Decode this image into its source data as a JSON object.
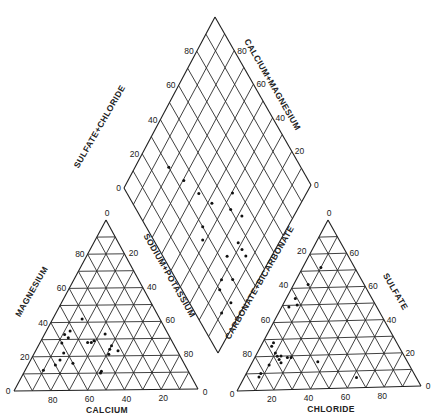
{
  "chart_data": {
    "type": "scatter",
    "components": {
      "cation_triangle": {
        "axes": {
          "magnesium": {
            "label": "MAGNESIUM",
            "ticks": [
              "20",
              "40",
              "60",
              "80"
            ]
          },
          "calcium": {
            "label": "CALCIUM",
            "ticks": [
              "80",
              "60",
              "40",
              "20"
            ]
          },
          "sodium_potassium": {
            "label": "SODIUM+POTASSIUM",
            "ticks": [
              "20",
              "40",
              "60",
              "80"
            ]
          }
        },
        "corner_labels": [
          "0",
          "0",
          "0"
        ],
        "points_pct": [
          {
            "ca": 42,
            "mg": 42,
            "na": 16
          },
          {
            "ca": 52,
            "mg": 35,
            "na": 13
          },
          {
            "ca": 56,
            "mg": 33,
            "na": 11
          },
          {
            "ca": 55,
            "mg": 31,
            "na": 14
          },
          {
            "ca": 60,
            "mg": 28,
            "na": 12
          },
          {
            "ca": 44,
            "mg": 28,
            "na": 28
          },
          {
            "ca": 42,
            "mg": 29,
            "na": 29
          },
          {
            "ca": 46,
            "mg": 28,
            "na": 26
          },
          {
            "ca": 36,
            "mg": 24,
            "na": 40
          },
          {
            "ca": 34,
            "mg": 26,
            "na": 40
          },
          {
            "ca": 32,
            "mg": 23,
            "na": 45
          },
          {
            "ca": 38,
            "mg": 21,
            "na": 41
          },
          {
            "ca": 62,
            "mg": 22,
            "na": 16
          },
          {
            "ca": 66,
            "mg": 18,
            "na": 16
          },
          {
            "ca": 60,
            "mg": 16,
            "na": 24
          },
          {
            "ca": 70,
            "mg": 15,
            "na": 15
          },
          {
            "ca": 78,
            "mg": 12,
            "na": 10
          },
          {
            "ca": 48,
            "mg": 10,
            "na": 42
          },
          {
            "ca": 47,
            "mg": 11,
            "na": 42
          },
          {
            "ca": 34,
            "mg": 33,
            "na": 33
          }
        ]
      },
      "anion_triangle": {
        "axes": {
          "sulfate": {
            "label": "SULFATE",
            "ticks": [
              "20",
              "40",
              "60",
              "60"
            ]
          },
          "chloride": {
            "label": "CHLORIDE",
            "ticks": [
              "20",
              "40",
              "60",
              "80"
            ]
          },
          "carbonate_bicarbonate": {
            "label": "CARBONATE+BICARBONATE",
            "ticks": [
              "20",
              "40",
              "60",
              "80"
            ]
          }
        },
        "corner_labels": [
          "0",
          "0",
          "0"
        ],
        "points_pct": [
          {
            "so4": 72,
            "cl": 10,
            "hco3": 18
          },
          {
            "so4": 62,
            "cl": 8,
            "hco3": 30
          },
          {
            "so4": 54,
            "cl": 5,
            "hco3": 41
          },
          {
            "so4": 50,
            "cl": 8,
            "hco3": 42
          },
          {
            "so4": 49,
            "cl": 4,
            "hco3": 47
          },
          {
            "so4": 26,
            "cl": 6,
            "hco3": 68
          },
          {
            "so4": 22,
            "cl": 10,
            "hco3": 68
          },
          {
            "so4": 20,
            "cl": 12,
            "hco3": 68
          },
          {
            "so4": 20,
            "cl": 14,
            "hco3": 66
          },
          {
            "so4": 19,
            "cl": 18,
            "hco3": 63
          },
          {
            "so4": 19,
            "cl": 20,
            "hco3": 61
          },
          {
            "so4": 18,
            "cl": 14,
            "hco3": 68
          },
          {
            "so4": 16,
            "cl": 16,
            "hco3": 68
          },
          {
            "so4": 15,
            "cl": 10,
            "hco3": 75
          },
          {
            "so4": 10,
            "cl": 8,
            "hco3": 82
          },
          {
            "so4": 8,
            "cl": 8,
            "hco3": 84
          },
          {
            "so4": 16,
            "cl": 36,
            "hco3": 48
          },
          {
            "so4": 6,
            "cl": 62,
            "hco3": 32
          },
          {
            "so4": 28,
            "cl": 6,
            "hco3": 66
          }
        ]
      },
      "diamond": {
        "axes": {
          "sulfate_chloride": {
            "label": "SULFATE+CHLORIDE",
            "ticks": [
              "0",
              "20",
              "40",
              "60",
              "80"
            ]
          },
          "calcium_magnesium": {
            "label": "CALCIUM+MAGNESIUM",
            "ticks": [
              "80",
              "60",
              "40",
              "20",
              "0"
            ]
          }
        },
        "points_pct": [
          {
            "so4cl": 82,
            "camg": 70
          },
          {
            "so4cl": 70,
            "camg": 66
          },
          {
            "so4cl": 58,
            "camg": 62
          },
          {
            "so4cl": 48,
            "camg": 58
          },
          {
            "so4cl": 36,
            "camg": 50
          },
          {
            "so4cl": 28,
            "camg": 46
          },
          {
            "so4cl": 22,
            "camg": 56
          },
          {
            "so4cl": 18,
            "camg": 56
          },
          {
            "so4cl": 14,
            "camg": 56
          },
          {
            "so4cl": 24,
            "camg": 66
          },
          {
            "so4cl": 20,
            "camg": 76
          },
          {
            "so4cl": 18,
            "camg": 80
          },
          {
            "so4cl": 10,
            "camg": 86
          },
          {
            "so4cl": 8,
            "camg": 78
          },
          {
            "so4cl": 14,
            "camg": 70
          },
          {
            "so4cl": 42,
            "camg": 74
          },
          {
            "so4cl": 40,
            "camg": 44
          },
          {
            "so4cl": 46,
            "camg": 70
          }
        ]
      }
    }
  },
  "labels": {
    "diamond_left_title": "SULFATE+CHLORIDE",
    "diamond_right_title": "CALCIUM+MAGNESIUM",
    "cation_left_title": "MAGNESIUM",
    "cation_bottom_title": "CALCIUM",
    "cation_right_title": "SODIUM+POTASSIUM",
    "anion_left_title": "CARBONATE+BICARBONATE",
    "anion_right_title": "SULFATE",
    "anion_bottom_title": "CHLORIDE"
  }
}
